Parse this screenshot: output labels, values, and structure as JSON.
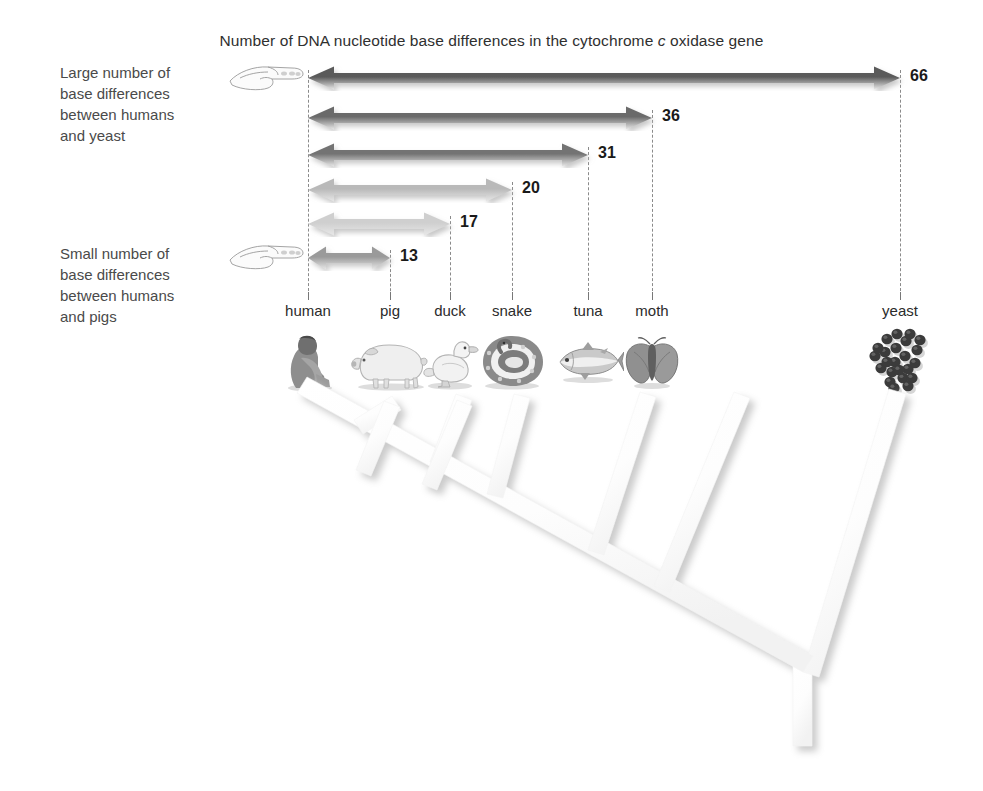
{
  "title": {
    "prefix": "Number of DNA nucleotide base differences in the cytochrome ",
    "italic": "c",
    "suffix": " oxidase gene"
  },
  "callouts": {
    "top": {
      "line1": "Large number of",
      "line2": "base differences",
      "line3": "between humans",
      "line4": "and yeast",
      "icon": "pointing-hand-icon"
    },
    "bottom": {
      "line1": "Small number of",
      "line2": "base differences",
      "line3": "between humans",
      "line4": "and pigs",
      "icon": "pointing-hand-icon"
    }
  },
  "species": [
    {
      "name": "human",
      "x": 308,
      "icon": "human-figure-icon"
    },
    {
      "name": "pig",
      "x": 390,
      "icon": "pig-icon"
    },
    {
      "name": "duck",
      "x": 450,
      "icon": "duck-icon"
    },
    {
      "name": "snake",
      "x": 512,
      "icon": "snake-icon"
    },
    {
      "name": "tuna",
      "x": 588,
      "icon": "tuna-icon"
    },
    {
      "name": "moth",
      "x": 652,
      "icon": "moth-icon"
    },
    {
      "name": "yeast",
      "x": 900,
      "icon": "yeast-cells-icon"
    }
  ],
  "chart_data": {
    "type": "bar",
    "title": "Number of DNA nucleotide base differences in the cytochrome c oxidase gene",
    "xlabel": "",
    "ylabel": "",
    "categories": [
      "yeast",
      "moth",
      "tuna",
      "snake",
      "duck",
      "pig"
    ],
    "values": [
      66,
      36,
      31,
      20,
      17,
      13
    ],
    "reference_species": "human",
    "note": "Each double-headed arrow spans from human to the compared species; the number is the count of DNA nucleotide base differences.",
    "series": [
      {
        "name": "base differences from human",
        "points": [
          {
            "species": "yeast",
            "value": 66,
            "from_x": 308,
            "to_x": 900,
            "y": 78,
            "color": "#5a5a5a",
            "label": "66",
            "label_x": 910
          },
          {
            "species": "moth",
            "value": 36,
            "from_x": 308,
            "to_x": 652,
            "y": 118,
            "color": "#6b6b6b",
            "label": "36",
            "label_x": 662
          },
          {
            "species": "tuna",
            "value": 31,
            "from_x": 308,
            "to_x": 588,
            "y": 155,
            "color": "#737373",
            "label": "31",
            "label_x": 598
          },
          {
            "species": "snake",
            "value": 20,
            "from_x": 308,
            "to_x": 512,
            "y": 190,
            "color": "#b9b9b9",
            "label": "20",
            "label_x": 522
          },
          {
            "species": "duck",
            "value": 17,
            "from_x": 308,
            "to_x": 450,
            "y": 224,
            "color": "#cfcfcf",
            "label": "17",
            "label_x": 460
          },
          {
            "species": "pig",
            "value": 13,
            "from_x": 308,
            "to_x": 390,
            "y": 258,
            "color": "#9a9a9a",
            "label": "13",
            "label_x": 400
          }
        ]
      }
    ],
    "grid": false,
    "legend": "none"
  },
  "tree": {
    "description": "Cladogram of relationships between human, pig, duck, snake, tuna, moth and yeast",
    "root_label": ""
  },
  "colors": {
    "background": "#ffffff",
    "text": "#333333",
    "label_text": "#4a4a4a",
    "dropline": "#8a8a8a",
    "tree_branch": "#ffffff",
    "tree_shadow": "#d9d9d9"
  }
}
